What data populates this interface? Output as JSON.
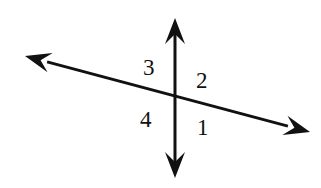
{
  "figure": {
    "background_color": "#ffffff",
    "stroke_color": "#111111",
    "width": 321,
    "height": 188
  },
  "labels": {
    "angle_1": "1",
    "angle_2": "2",
    "angle_3": "3",
    "angle_4": "4"
  },
  "geometry": {
    "intersection": {
      "x": 175,
      "y": 97
    },
    "vertical_line": {
      "name": "vertical-double-arrow-line",
      "from": {
        "x": 175,
        "y": 178
      },
      "to": {
        "x": 175,
        "y": 18
      },
      "stroke_width": 3,
      "arrowheads": "both"
    },
    "diagonal_line": {
      "name": "diagonal-double-arrow-line",
      "from": {
        "x": 25,
        "y": 56
      },
      "to": {
        "x": 310,
        "y": 132
      },
      "stroke_width": 3,
      "arrowheads": "both"
    },
    "arrowhead": {
      "length": 26,
      "half_width": 10
    }
  }
}
